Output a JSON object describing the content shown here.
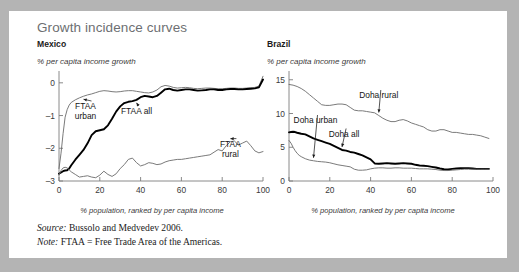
{
  "figure": {
    "title": "Growth incidence curves",
    "source_label": "Source:",
    "source_text": " Bussolo and Medvedev 2006.",
    "note_label": "Note:",
    "note_text": " FTAA = Free Trade Area of the Americas."
  },
  "chart_data": [
    {
      "type": "line",
      "title": "Mexico",
      "ylabel": "% per capita income growth",
      "xlabel": "% population, ranked by per capita income",
      "xlim": [
        0,
        100
      ],
      "ylim": [
        -3,
        0.3
      ],
      "xticks": [
        0,
        20,
        40,
        60,
        80,
        100
      ],
      "xticklabels": [
        "0",
        "20",
        "40",
        "60",
        "80",
        "100"
      ],
      "yticks": [
        0,
        -1,
        -2,
        -3
      ],
      "yticklabels": [
        "0",
        "–1",
        "–2",
        "–3"
      ],
      "grid": false,
      "legend": "annotations",
      "annotations": [
        {
          "label": "FTAA\nurban",
          "series": "FTAA urban",
          "x": 13,
          "y": -0.8
        },
        {
          "label": "FTAA all",
          "series": "FTAA all",
          "x": 38,
          "y": -0.95
        },
        {
          "label": "FTAA\nrural",
          "series": "FTAA rural",
          "x": 84,
          "y": -1.95
        }
      ],
      "series": [
        {
          "name": "FTAA urban",
          "style": "thin",
          "x": [
            0,
            1,
            2,
            3,
            4,
            5,
            6,
            8,
            10,
            12,
            14,
            16,
            18,
            20,
            22,
            24,
            26,
            28,
            30,
            32,
            34,
            36,
            38,
            40,
            42,
            44,
            46,
            48,
            50,
            52,
            54,
            56,
            58,
            60,
            62,
            64,
            66,
            68,
            70,
            72,
            74,
            76,
            78,
            80,
            82,
            84,
            86,
            88,
            90,
            92,
            94,
            96,
            98,
            100
          ],
          "y": [
            -2.62,
            -2.15,
            -1.55,
            -1.05,
            -0.82,
            -0.68,
            -0.6,
            -0.52,
            -0.46,
            -0.41,
            -0.37,
            -0.34,
            -0.3,
            -0.26,
            -0.24,
            -0.25,
            -0.27,
            -0.28,
            -0.27,
            -0.25,
            -0.24,
            -0.24,
            -0.26,
            -0.28,
            -0.3,
            -0.31,
            -0.28,
            -0.22,
            -0.12,
            -0.08,
            -0.1,
            -0.14,
            -0.16,
            -0.15,
            -0.14,
            -0.15,
            -0.17,
            -0.18,
            -0.17,
            -0.16,
            -0.16,
            -0.17,
            -0.18,
            -0.18,
            -0.17,
            -0.16,
            -0.16,
            -0.17,
            -0.17,
            -0.16,
            -0.15,
            -0.14,
            -0.1,
            0.2
          ]
        },
        {
          "name": "FTAA all",
          "style": "thick",
          "x": [
            0,
            1,
            2,
            3,
            4,
            5,
            6,
            8,
            10,
            12,
            14,
            16,
            18,
            20,
            22,
            24,
            26,
            28,
            30,
            32,
            34,
            36,
            38,
            40,
            42,
            44,
            46,
            48,
            50,
            52,
            54,
            56,
            58,
            60,
            62,
            64,
            66,
            68,
            70,
            72,
            74,
            76,
            78,
            80,
            82,
            84,
            86,
            88,
            90,
            92,
            94,
            96,
            98,
            100
          ],
          "y": [
            -2.78,
            -2.74,
            -2.7,
            -2.68,
            -2.67,
            -2.62,
            -2.52,
            -2.35,
            -2.2,
            -2.05,
            -1.85,
            -1.6,
            -1.48,
            -1.45,
            -1.42,
            -1.3,
            -1.1,
            -0.88,
            -0.72,
            -0.62,
            -0.58,
            -0.56,
            -0.52,
            -0.44,
            -0.4,
            -0.42,
            -0.44,
            -0.4,
            -0.3,
            -0.2,
            -0.18,
            -0.22,
            -0.24,
            -0.22,
            -0.2,
            -0.2,
            -0.22,
            -0.24,
            -0.23,
            -0.22,
            -0.2,
            -0.2,
            -0.22,
            -0.22,
            -0.2,
            -0.19,
            -0.19,
            -0.2,
            -0.2,
            -0.19,
            -0.18,
            -0.17,
            -0.14,
            0.1
          ]
        },
        {
          "name": "FTAA rural",
          "style": "thin",
          "x": [
            0,
            1,
            2,
            3,
            4,
            5,
            6,
            8,
            10,
            12,
            14,
            16,
            18,
            20,
            22,
            24,
            26,
            28,
            30,
            32,
            34,
            36,
            38,
            40,
            42,
            44,
            46,
            48,
            50,
            52,
            54,
            56,
            58,
            60,
            62,
            64,
            66,
            68,
            70,
            72,
            74,
            76,
            78,
            80,
            82,
            84,
            86,
            88,
            90,
            92,
            94,
            96,
            98,
            100
          ],
          "y": [
            -2.82,
            -2.68,
            -2.6,
            -2.58,
            -2.6,
            -2.66,
            -2.72,
            -2.8,
            -2.88,
            -2.86,
            -2.84,
            -2.88,
            -2.9,
            -2.82,
            -2.7,
            -2.8,
            -2.86,
            -2.78,
            -2.62,
            -2.5,
            -2.34,
            -2.3,
            -2.44,
            -2.54,
            -2.5,
            -2.44,
            -2.46,
            -2.5,
            -2.48,
            -2.42,
            -2.38,
            -2.36,
            -2.34,
            -2.34,
            -2.32,
            -2.3,
            -2.28,
            -2.26,
            -2.24,
            -2.22,
            -2.2,
            -2.12,
            -2.04,
            -2.08,
            -1.92,
            -1.8,
            -1.78,
            -1.9,
            -1.84,
            -1.78,
            -1.92,
            -2.08,
            -2.14,
            -2.1
          ]
        }
      ]
    },
    {
      "type": "line",
      "title": "Brazil",
      "ylabel": "% per capita income growth",
      "xlabel": "% population, ranked by per capita income",
      "xlim": [
        0,
        100
      ],
      "ylim": [
        0,
        16
      ],
      "xticks": [
        0,
        20,
        40,
        60,
        80,
        100
      ],
      "xticklabels": [
        "0",
        "20",
        "40",
        "60",
        "80",
        "100"
      ],
      "yticks": [
        0,
        5,
        10,
        15
      ],
      "yticklabels": [
        "0",
        "5",
        "10",
        "15"
      ],
      "grid": false,
      "legend": "annotations",
      "annotations": [
        {
          "label": "Doha rural",
          "series": "Doha rural",
          "x": 44,
          "y": 12.3
        },
        {
          "label": "Doha urban",
          "series": "Doha urban",
          "x": 13,
          "y": 8.6
        },
        {
          "label": "Doha all",
          "series": "Doha all",
          "x": 27,
          "y": 6.6
        }
      ],
      "series": [
        {
          "name": "Doha rural",
          "style": "thin",
          "x": [
            0,
            2,
            4,
            6,
            8,
            10,
            12,
            14,
            16,
            18,
            20,
            22,
            24,
            26,
            28,
            30,
            32,
            34,
            36,
            38,
            40,
            42,
            44,
            46,
            48,
            50,
            52,
            54,
            56,
            58,
            60,
            62,
            64,
            66,
            68,
            70,
            72,
            74,
            76,
            78,
            80,
            82,
            84,
            86,
            88,
            90,
            92,
            94,
            96,
            98
          ],
          "y": [
            14.3,
            14.2,
            14.0,
            13.7,
            13.3,
            12.8,
            12.3,
            11.8,
            11.3,
            11.2,
            11.2,
            11.3,
            11.4,
            11.4,
            11.3,
            10.9,
            10.5,
            10.4,
            10.4,
            10.3,
            10.2,
            10.1,
            9.7,
            9.3,
            9.0,
            8.8,
            8.8,
            9.0,
            9.1,
            8.9,
            8.6,
            8.4,
            8.2,
            8.0,
            7.6,
            7.4,
            7.4,
            7.6,
            7.6,
            7.4,
            7.2,
            7.2,
            7.1,
            7.0,
            6.9,
            6.9,
            6.8,
            6.7,
            6.5,
            6.3
          ]
        },
        {
          "name": "Doha all",
          "style": "thick",
          "x": [
            0,
            1,
            2,
            3,
            4,
            6,
            8,
            10,
            12,
            14,
            16,
            18,
            20,
            22,
            24,
            26,
            28,
            30,
            32,
            34,
            36,
            38,
            40,
            42,
            44,
            46,
            48,
            50,
            52,
            54,
            56,
            58,
            60,
            62,
            64,
            66,
            68,
            70,
            72,
            74,
            76,
            78,
            80,
            82,
            84,
            86,
            88,
            90,
            92,
            94,
            96,
            98
          ],
          "y": [
            7.2,
            7.25,
            7.3,
            7.25,
            7.15,
            7.0,
            6.9,
            6.6,
            6.3,
            6.1,
            5.9,
            5.7,
            5.5,
            5.2,
            4.9,
            4.6,
            4.5,
            4.3,
            4.2,
            4.0,
            3.8,
            3.5,
            3.2,
            2.6,
            2.55,
            2.6,
            2.65,
            2.6,
            2.55,
            2.6,
            2.65,
            2.6,
            2.55,
            2.4,
            2.3,
            2.25,
            2.2,
            2.1,
            2.0,
            1.85,
            1.75,
            1.7,
            1.8,
            1.85,
            1.9,
            1.9,
            1.9,
            1.85,
            1.8,
            1.8,
            1.8,
            1.8
          ]
        },
        {
          "name": "Doha urban",
          "style": "thin",
          "x": [
            0,
            1,
            2,
            3,
            4,
            5,
            6,
            8,
            10,
            12,
            14,
            16,
            18,
            20,
            22,
            24,
            26,
            28,
            30,
            32,
            34,
            36,
            38,
            40,
            42,
            44,
            46,
            48,
            50,
            52,
            54,
            56,
            58,
            60,
            62,
            64,
            66,
            68,
            70,
            72,
            74,
            76,
            78,
            80,
            82,
            84,
            86,
            88,
            90,
            92,
            94,
            96,
            98
          ],
          "y": [
            6.0,
            5.6,
            5.0,
            4.5,
            4.1,
            3.8,
            3.6,
            3.3,
            3.1,
            3.0,
            2.9,
            2.85,
            2.8,
            2.7,
            2.55,
            2.4,
            2.3,
            2.2,
            2.1,
            1.75,
            1.6,
            1.6,
            1.65,
            1.8,
            1.9,
            1.95,
            1.95,
            1.9,
            1.9,
            1.95,
            1.95,
            1.9,
            1.9,
            1.9,
            1.85,
            1.8,
            1.8,
            1.8,
            1.75,
            1.7,
            1.6,
            1.55,
            1.55,
            1.6,
            1.65,
            1.7,
            1.75,
            1.75,
            1.75,
            1.75,
            1.75,
            1.75,
            1.75
          ]
        }
      ]
    }
  ]
}
